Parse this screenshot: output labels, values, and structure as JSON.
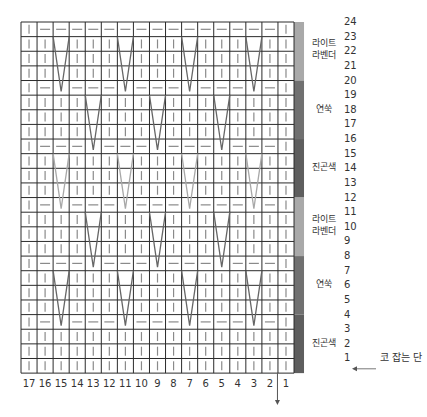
{
  "chart": {
    "title": "",
    "columns": 17,
    "rows": 24,
    "column_numbers": [
      "17",
      "16",
      "15",
      "14",
      "13",
      "12",
      "11",
      "10",
      "9",
      "8",
      "7",
      "6",
      "5",
      "4",
      "3",
      "2",
      "1"
    ],
    "row_numbers": [
      "24",
      "23",
      "22",
      "21",
      "20",
      "19",
      "18",
      "17",
      "16",
      "15",
      "14",
      "13",
      "12",
      "11",
      "10",
      "9",
      "8",
      "7",
      "6",
      "5",
      "4",
      "3",
      "2",
      "1"
    ],
    "cast_on_label": "코 잡는 단",
    "cast_on_row": "1",
    "colors": {
      "grid_line": "#2b2b2b",
      "knit_symbol": "#8a8a8a",
      "v_dark": "#666666",
      "v_light": "#a8a8a8",
      "lavender": "#a9a9a9",
      "yeonssuk": "#707070",
      "navy": "#5e5e5e"
    },
    "bands": [
      {
        "label_line1": "라이트",
        "label_line2": "라벤더",
        "rows": [
          24,
          21
        ],
        "color": "#a9a9a9"
      },
      {
        "label_line1": "연쑥",
        "label_line2": "",
        "rows": [
          20,
          17
        ],
        "color": "#707070"
      },
      {
        "label_line1": "진곤색",
        "label_line2": "",
        "rows": [
          16,
          13
        ],
        "color": "#5e5e5e"
      },
      {
        "label_line1": "라이트",
        "label_line2": "라벤더",
        "rows": [
          12,
          9
        ],
        "color": "#a9a9a9"
      },
      {
        "label_line1": "연쑥",
        "label_line2": "",
        "rows": [
          8,
          5
        ],
        "color": "#707070"
      },
      {
        "label_line1": "진곤색",
        "label_line2": "",
        "rows": [
          4,
          1
        ],
        "color": "#5e5e5e"
      }
    ],
    "symbols_legend": {
      "|": "knit",
      "—": "purl",
      "V": "slipped/elongated stitch"
    },
    "grid_rows": [
      {
        "row": 24,
        "cells": "|---------------|"
      },
      {
        "row": 23,
        "cells": "||V|||V|||V|||V||"
      },
      {
        "row": 22,
        "cells": "||V|||V|||V|||V||"
      },
      {
        "row": 21,
        "cells": "||V|||V|||V|||V||"
      },
      {
        "row": 20,
        "cells": "|-V---V---V---V-|"
      },
      {
        "row": 19,
        "cells": "||||V|||V|||V||||"
      },
      {
        "row": 18,
        "cells": "||||V|||V|||V||||"
      },
      {
        "row": 17,
        "cells": "||||V|||V|||V||||"
      },
      {
        "row": 16,
        "cells": "|---V---V---V---|"
      },
      {
        "row": 15,
        "cells": "||V|||V|||V|||V||"
      },
      {
        "row": 14,
        "cells": "||V|||V|||V|||V||"
      },
      {
        "row": 13,
        "cells": "||V|||V|||V|||V||"
      },
      {
        "row": 12,
        "cells": "|-V---V---V---V-|"
      },
      {
        "row": 11,
        "cells": "||||V|||V|||V||||"
      },
      {
        "row": 10,
        "cells": "||||V|||V|||V||||"
      },
      {
        "row": 9,
        "cells": "||||V|||V|||V||||"
      },
      {
        "row": 8,
        "cells": "|---V---V---V---|"
      },
      {
        "row": 7,
        "cells": "||V|||V|||V|||V||"
      },
      {
        "row": 6,
        "cells": "||V|||V|||V|||V||"
      },
      {
        "row": 5,
        "cells": "||V|||V|||V|||V||"
      },
      {
        "row": 4,
        "cells": "|-V---V---V---V-|"
      },
      {
        "row": 3,
        "cells": "|||||||||||||||||"
      },
      {
        "row": 2,
        "cells": "|||||||||||||||||"
      },
      {
        "row": 1,
        "cells": "|||||||||||||||||"
      }
    ],
    "v_groups": [
      {
        "top_row": 23,
        "bottom_row": 20,
        "columns": [
          15,
          11,
          7,
          3
        ],
        "tone": "dark"
      },
      {
        "top_row": 19,
        "bottom_row": 16,
        "columns": [
          13,
          9,
          5
        ],
        "tone": "dark"
      },
      {
        "top_row": 15,
        "bottom_row": 12,
        "columns": [
          15,
          11,
          7,
          3
        ],
        "tone": "light"
      },
      {
        "top_row": 11,
        "bottom_row": 8,
        "columns": [
          13,
          9,
          5
        ],
        "tone": "dark"
      },
      {
        "top_row": 7,
        "bottom_row": 4,
        "columns": [
          15,
          11,
          7,
          3
        ],
        "tone": "dark"
      }
    ]
  }
}
